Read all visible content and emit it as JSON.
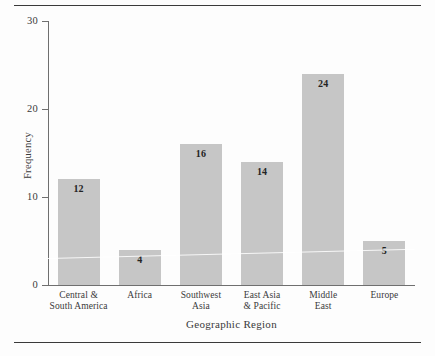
{
  "chart_data": {
    "type": "bar",
    "title": "",
    "xlabel": "Geographic Region",
    "ylabel": "Frequency",
    "categories": [
      "Central &\nSouth America",
      "Africa",
      "Southwest\nAsia",
      "East Asia\n& Pacific",
      "Middle\nEast",
      "Europe"
    ],
    "category_lines": [
      [
        "Central &",
        "South America"
      ],
      [
        "Africa",
        ""
      ],
      [
        "Southwest",
        "Asia"
      ],
      [
        "East Asia",
        "& Pacific"
      ],
      [
        "Middle",
        "East"
      ],
      [
        "Europe",
        ""
      ]
    ],
    "values": [
      12,
      4,
      16,
      14,
      24,
      5
    ],
    "data_labels": [
      "12",
      "4",
      "16",
      "14",
      "24",
      "5"
    ],
    "ylim": [
      0,
      30
    ],
    "ytick_labels": [
      "0",
      "10",
      "20",
      "30"
    ],
    "ytick_values": [
      0,
      10,
      20,
      30
    ],
    "grid": false,
    "legend": null,
    "bar_color": "#c6c6c6",
    "axis_color": "#6f6f6f",
    "text_color": "#3a3a3a"
  }
}
